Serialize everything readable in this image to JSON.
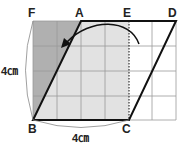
{
  "diagram": {
    "type": "geometry-grid",
    "grid": {
      "columns": 6,
      "rows": 4
    },
    "points": {
      "F": "F",
      "A": "A",
      "E": "E",
      "D": "D",
      "B": "B",
      "C": "C"
    },
    "dimensions": {
      "left_side": "4㎝",
      "bottom_side": "4㎝"
    },
    "shapes": {
      "parallelogram": "ABCD",
      "rectangle": "FBCE"
    },
    "colors": {
      "dark_shade": "#b0b0b0",
      "light_shade": "#e2e2e2",
      "grid_line": "#999999",
      "outline": "#111111"
    }
  }
}
